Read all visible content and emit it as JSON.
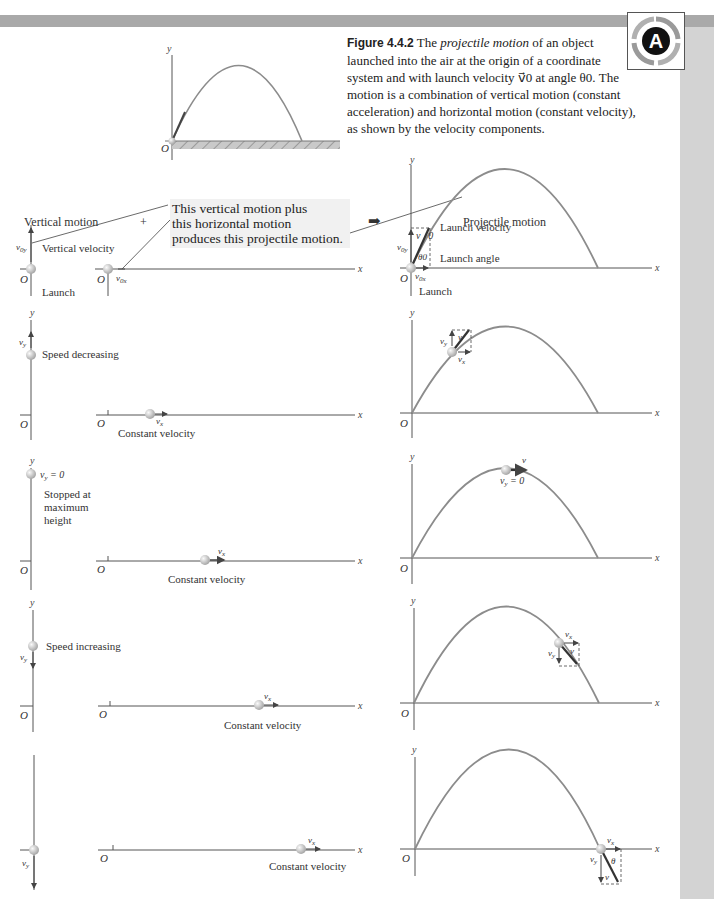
{
  "figure": {
    "number": "Figure 4.4.2",
    "caption_pre": "The ",
    "caption_italic": "projectile motion",
    "caption_post": " of an object launched into the air at the origin of a coordinate system and with launch velocity v⃗0 at angle θ0. The motion is a combination of vertical motion (constant acceleration) and horizontal motion (constant velocity), as shown by the velocity components."
  },
  "logo": {
    "icon": "A-badge-icon",
    "letter": "A"
  },
  "headers": {
    "vertical": "Vertical motion",
    "plus": "+",
    "horizontal": "Horizontal motion",
    "arrow": "➡",
    "projectile": "Projectile motion"
  },
  "callout": {
    "line1": "This vertical motion plus",
    "line2": "this horizontal motion",
    "line3": "produces this projectile motion."
  },
  "axes": {
    "x": "x",
    "y": "y",
    "origin": "O"
  },
  "rows": [
    {
      "stage": "launch",
      "vertical_labels": [
        "v0y",
        "Vertical velocity",
        "Launch"
      ],
      "horizontal_labels": [
        "v0x"
      ],
      "projectile_labels": [
        "v⃗0",
        "Launch velocity",
        "v0y",
        "θ0",
        "Launch angle",
        "v0x",
        "Launch"
      ]
    },
    {
      "stage": "rising",
      "vertical_labels": [
        "vy",
        "Speed decreasing"
      ],
      "horizontal_labels": [
        "vx",
        "Constant velocity"
      ],
      "projectile_labels": [
        "vy",
        "v⃗",
        "vx"
      ]
    },
    {
      "stage": "peak",
      "vertical_labels": [
        "vy = 0",
        "Stopped at",
        "maximum",
        "height"
      ],
      "horizontal_labels": [
        "vx",
        "Constant velocity"
      ],
      "projectile_labels": [
        "v⃗",
        "vy = 0"
      ]
    },
    {
      "stage": "falling",
      "vertical_labels": [
        "vy",
        "Speed increasing"
      ],
      "horizontal_labels": [
        "vx",
        "Constant velocity"
      ],
      "projectile_labels": [
        "vx",
        "vy",
        "v⃗"
      ]
    },
    {
      "stage": "landing",
      "vertical_labels": [
        "vy"
      ],
      "horizontal_labels": [
        "vx",
        "Constant velocity"
      ],
      "projectile_labels": [
        "vx",
        "vy",
        "θ",
        "v⃗"
      ]
    }
  ],
  "colors": {
    "trajectory": "#8c8c8c",
    "axis": "#555555",
    "vector": "#333333",
    "ball": "#cfcfcf",
    "topbar": "#a9a9a9",
    "sidebar": "#d3d3d3",
    "callout_bg": "#f1f1f1"
  }
}
